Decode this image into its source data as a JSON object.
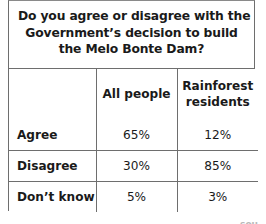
{
  "card": {
    "question": {
      "lines": [
        "Do you agree or disagree with the",
        "Government’s decision to build",
        "the Melo Bonte Dam?"
      ]
    },
    "table": {
      "corner_label": "",
      "column_headers": [
        {
          "lines": [
            "All people"
          ]
        },
        {
          "lines": [
            "Rainforest",
            "residents"
          ]
        }
      ],
      "rows": [
        {
          "label": "Agree",
          "values": [
            "65%",
            "12%"
          ]
        },
        {
          "label": "Disagree",
          "values": [
            "30%",
            "85%"
          ]
        },
        {
          "label": "Don’t know",
          "values": [
            "5%",
            "3%"
          ]
        }
      ]
    }
  },
  "source_credit": "sou",
  "colors": {
    "border": "#6e6e6e",
    "text": "#1a1a1a",
    "background": "#ffffff",
    "credit_text": "#b9b9b9"
  }
}
